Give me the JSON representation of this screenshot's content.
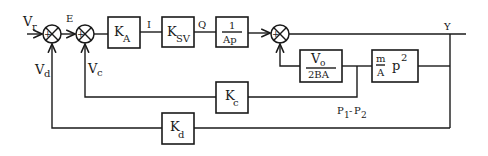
{
  "diagram": {
    "type": "control-block-diagram",
    "signals": {
      "input": {
        "main": "V",
        "sub": "r"
      },
      "error": "E",
      "current": "I",
      "flow": "Q",
      "output": "Y",
      "disp_feedback": {
        "main": "V",
        "sub": "d"
      },
      "press_feedback": {
        "main": "V",
        "sub": "c"
      },
      "pressure": {
        "p1": "P",
        "s1": "1",
        "dash": "-",
        "p2": "P",
        "s2": "2"
      }
    },
    "blocks": {
      "ka": {
        "main": "K",
        "sub": "A"
      },
      "ksv": {
        "main": "K",
        "sub": "SV"
      },
      "int": {
        "num": "1",
        "den": "Ap"
      },
      "vol": {
        "num_main": "V",
        "num_sub": "o",
        "den": "2BA"
      },
      "mass": {
        "num": "m",
        "den": "A",
        "p": "p",
        "exp": "2"
      },
      "kc": {
        "main": "K",
        "sub": "c"
      },
      "kd": {
        "main": "K",
        "sub": "d"
      }
    },
    "junction_signs": {
      "plus": "+",
      "minus": "−"
    }
  }
}
